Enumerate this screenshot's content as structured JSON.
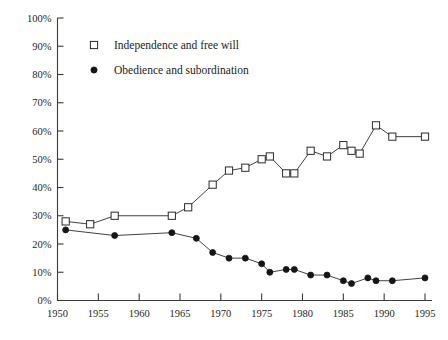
{
  "chart_data": {
    "type": "line",
    "title": "",
    "subtitle": "",
    "xlabel": "",
    "ylabel": "",
    "xlim": [
      1950,
      1996
    ],
    "ylim": [
      0,
      100
    ],
    "grid": false,
    "legend_position": "top-left",
    "x_ticks": [
      "1950",
      "1955",
      "1960",
      "1965",
      "1970",
      "1975",
      "1980",
      "1985",
      "1990",
      "1995"
    ],
    "x_tick_values": [
      1950,
      1955,
      1960,
      1965,
      1970,
      1975,
      1980,
      1985,
      1990,
      1995
    ],
    "y_ticks": [
      "0%",
      "10%",
      "20%",
      "30%",
      "40%",
      "50%",
      "60%",
      "70%",
      "80%",
      "90%",
      "100%"
    ],
    "y_tick_values": [
      0,
      10,
      20,
      30,
      40,
      50,
      60,
      70,
      80,
      90,
      100
    ],
    "series": [
      {
        "name": "Independence and free will",
        "marker": "open-square",
        "color": "#2b2b2b",
        "points": [
          {
            "x": 1951,
            "y": 28
          },
          {
            "x": 1954,
            "y": 27
          },
          {
            "x": 1957,
            "y": 30
          },
          {
            "x": 1964,
            "y": 30
          },
          {
            "x": 1966,
            "y": 33
          },
          {
            "x": 1969,
            "y": 41
          },
          {
            "x": 1971,
            "y": 46
          },
          {
            "x": 1973,
            "y": 47
          },
          {
            "x": 1975,
            "y": 50
          },
          {
            "x": 1976,
            "y": 51
          },
          {
            "x": 1978,
            "y": 45
          },
          {
            "x": 1979,
            "y": 45
          },
          {
            "x": 1981,
            "y": 53
          },
          {
            "x": 1983,
            "y": 51
          },
          {
            "x": 1985,
            "y": 55
          },
          {
            "x": 1986,
            "y": 53
          },
          {
            "x": 1987,
            "y": 52
          },
          {
            "x": 1989,
            "y": 62
          },
          {
            "x": 1991,
            "y": 58
          },
          {
            "x": 1995,
            "y": 58
          }
        ]
      },
      {
        "name": "Obedience and subordination",
        "marker": "filled-circle",
        "color": "#151515",
        "points": [
          {
            "x": 1951,
            "y": 25
          },
          {
            "x": 1957,
            "y": 23
          },
          {
            "x": 1964,
            "y": 24
          },
          {
            "x": 1967,
            "y": 22
          },
          {
            "x": 1969,
            "y": 17
          },
          {
            "x": 1971,
            "y": 15
          },
          {
            "x": 1973,
            "y": 15
          },
          {
            "x": 1975,
            "y": 13
          },
          {
            "x": 1976,
            "y": 10
          },
          {
            "x": 1978,
            "y": 11
          },
          {
            "x": 1979,
            "y": 11
          },
          {
            "x": 1981,
            "y": 9
          },
          {
            "x": 1983,
            "y": 9
          },
          {
            "x": 1985,
            "y": 7
          },
          {
            "x": 1986,
            "y": 6
          },
          {
            "x": 1988,
            "y": 8
          },
          {
            "x": 1989,
            "y": 7
          },
          {
            "x": 1991,
            "y": 7
          },
          {
            "x": 1995,
            "y": 8
          }
        ]
      }
    ],
    "legend": [
      {
        "label": "Independence and free will",
        "marker": "open-square"
      },
      {
        "label": "Obedience and subordination",
        "marker": "filled-circle"
      }
    ]
  }
}
